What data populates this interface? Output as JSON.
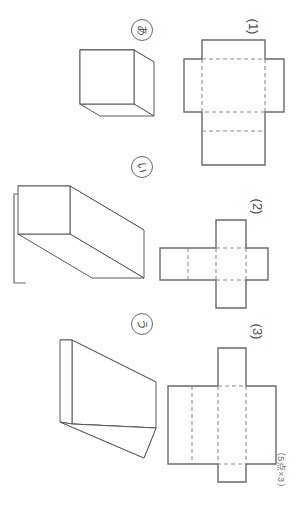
{
  "worksheet": {
    "points_note": "（5点×3）",
    "orientation_degrees": 90
  },
  "problems": [
    {
      "id": "problem-1",
      "solid_label": "あ",
      "solid_name": "cube",
      "solid_description": "立方体",
      "net_label": "(1)",
      "net_name": "cross-net-tall",
      "net_description": "十字形の展開図（縦長）"
    },
    {
      "id": "problem-2",
      "solid_label": "い",
      "solid_name": "long-rectangular-prism",
      "solid_description": "直方体（細長い）",
      "net_label": "(2)",
      "net_name": "plus-net",
      "net_description": "プラス形の展開図"
    },
    {
      "id": "problem-3",
      "solid_label": "う",
      "solid_name": "flat-slab-prism",
      "solid_description": "直方体（平たい）",
      "net_label": "(3)",
      "net_name": "wide-cross-net",
      "net_description": "横長十字形の展開図"
    }
  ],
  "colors": {
    "paper": "#ffffff",
    "solid_stroke": "#5a5a5a",
    "net_stroke": "#6a6a6a",
    "fold_stroke": "#8c8c8c",
    "label_text": "#4a4a4a"
  }
}
